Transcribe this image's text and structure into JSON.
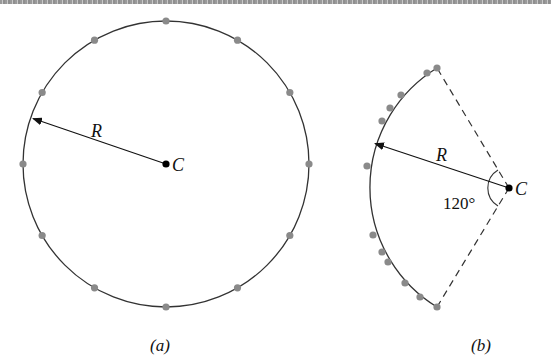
{
  "figure": {
    "panel_a": {
      "caption": "(a)",
      "center_label": "C",
      "radius_label": "R",
      "center": [
        166,
        164
      ],
      "radius": 143,
      "dot_count": 12,
      "dot_spacing_deg": 30
    },
    "panel_b": {
      "caption": "(b)",
      "center_label": "C",
      "radius_label": "R",
      "angle_label": "120°",
      "center": [
        509,
        188
      ],
      "arc_angle_deg": 120,
      "dot_count": 12
    },
    "colors": {
      "line": "#333333",
      "dot": "#8a8a8a",
      "center_dot": "#000000"
    }
  }
}
